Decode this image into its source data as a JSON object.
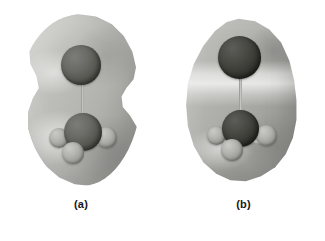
{
  "figure": {
    "type": "molecular-electron-density-isosurface",
    "background_color": "#ffffff",
    "panels": [
      {
        "id": "a",
        "caption": "(a)",
        "surface_label": "electron-density-isosurface",
        "surface_shape": "peanut-gourd",
        "surface_color": "#b5b5b1",
        "atoms": [
          {
            "name": "top-atom",
            "role": "terminal-heavy-atom",
            "shade": "dark",
            "position": "top-center"
          },
          {
            "name": "center-atom",
            "role": "central-atom",
            "shade": "dark",
            "position": "center"
          },
          {
            "name": "hydrogen-1",
            "role": "hydrogen",
            "shade": "light",
            "position": "lower-left"
          },
          {
            "name": "hydrogen-2",
            "role": "hydrogen",
            "shade": "light",
            "position": "lower-right"
          },
          {
            "name": "hydrogen-3",
            "role": "hydrogen",
            "shade": "light",
            "position": "bottom-front"
          }
        ],
        "bonds": [
          {
            "name": "bond-center-top",
            "from": "center-atom",
            "to": "top-atom"
          },
          {
            "name": "bond-center-h1",
            "from": "center-atom",
            "to": "hydrogen-1"
          },
          {
            "name": "bond-center-h2",
            "from": "center-atom",
            "to": "hydrogen-2"
          },
          {
            "name": "bond-center-h3",
            "from": "center-atom",
            "to": "hydrogen-3"
          }
        ]
      },
      {
        "id": "b",
        "caption": "(b)",
        "surface_label": "electron-density-isosurface",
        "surface_shape": "egg-teardrop",
        "surface_color": "#aaaaa6",
        "highlight": "horizontal-bright-band",
        "atoms": [
          {
            "name": "top-atom",
            "role": "terminal-heavy-atom",
            "shade": "darker",
            "position": "top-center"
          },
          {
            "name": "center-atom",
            "role": "central-atom",
            "shade": "darker",
            "position": "center"
          },
          {
            "name": "hydrogen-1",
            "role": "hydrogen",
            "shade": "light",
            "position": "lower-left"
          },
          {
            "name": "hydrogen-2",
            "role": "hydrogen",
            "shade": "light",
            "position": "lower-right"
          },
          {
            "name": "hydrogen-3",
            "role": "hydrogen",
            "shade": "light",
            "position": "bottom-front"
          }
        ],
        "bonds": [
          {
            "name": "bond-center-top",
            "from": "center-atom",
            "to": "top-atom"
          },
          {
            "name": "bond-center-h1",
            "from": "center-atom",
            "to": "hydrogen-1"
          },
          {
            "name": "bond-center-h2",
            "from": "center-atom",
            "to": "hydrogen-2"
          },
          {
            "name": "bond-center-h3",
            "from": "center-atom",
            "to": "hydrogen-3"
          }
        ]
      }
    ]
  }
}
